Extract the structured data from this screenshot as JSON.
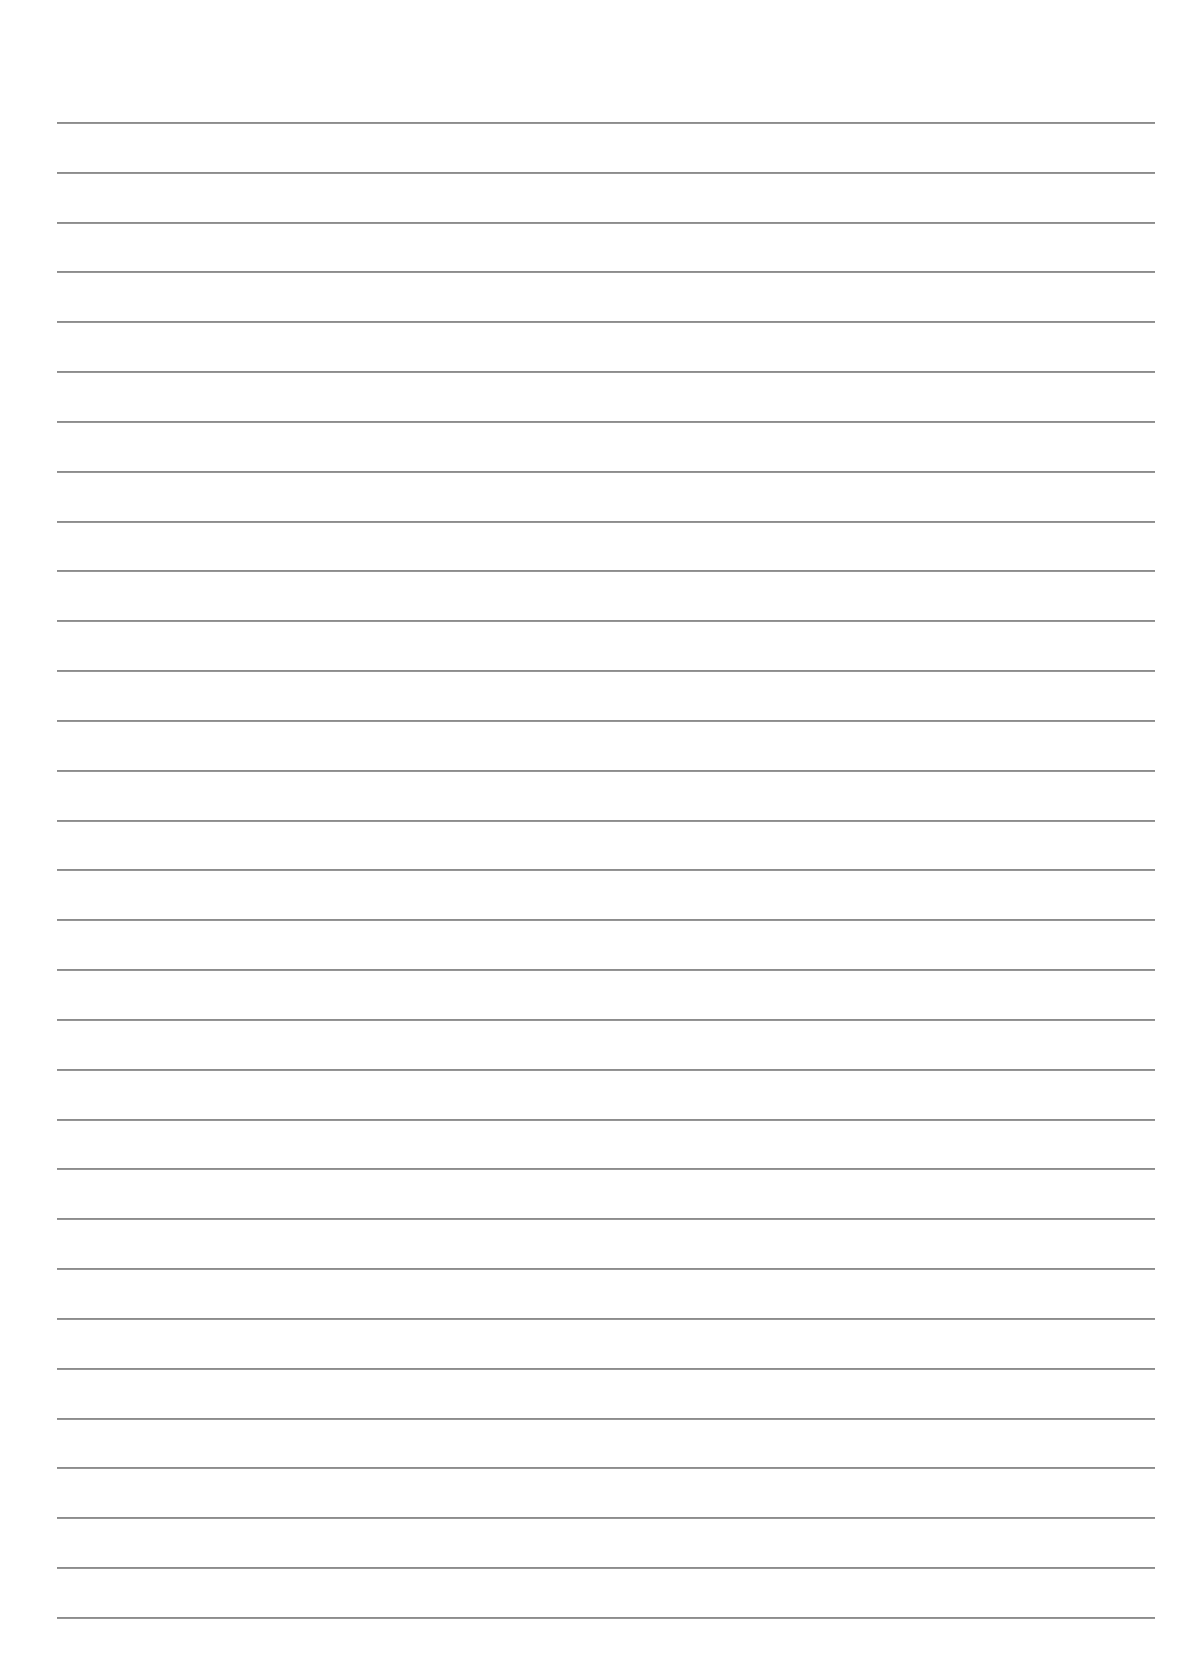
{
  "page": {
    "type": "ruled-paper",
    "background_color": "#ffffff",
    "line_color": "#8c8c8c",
    "line_count": 31,
    "first_line_y": 122,
    "line_spacing": 49.83,
    "line_left": 57,
    "line_right": 1155,
    "text": ""
  }
}
